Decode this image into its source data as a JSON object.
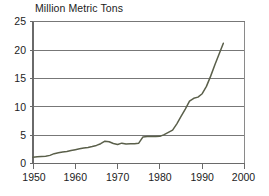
{
  "chart_data": {
    "type": "line",
    "title": "Million Metric Tons",
    "xlabel": "",
    "ylabel": "",
    "xlim": [
      1950,
      2000
    ],
    "ylim": [
      0,
      25
    ],
    "grid": true,
    "legend": "none",
    "x_ticks": [
      "1950",
      "1960",
      "1970",
      "1980",
      "1990",
      "2000"
    ],
    "x_tick_values": [
      1950,
      1960,
      1970,
      1980,
      1990,
      2000
    ],
    "y_ticks": [
      "0",
      "5",
      "10",
      "15",
      "20",
      "25"
    ],
    "y_tick_values": [
      0,
      5,
      10,
      15,
      20,
      25
    ],
    "line_color": "#5a5f4a",
    "series": [
      {
        "name": "Million Metric Tons",
        "x": [
          1950,
          1951,
          1952,
          1953,
          1954,
          1955,
          1956,
          1957,
          1958,
          1959,
          1960,
          1961,
          1962,
          1963,
          1964,
          1965,
          1966,
          1967,
          1968,
          1969,
          1970,
          1971,
          1972,
          1973,
          1974,
          1975,
          1976,
          1977,
          1978,
          1979,
          1980,
          1981,
          1982,
          1983,
          1984,
          1985,
          1986,
          1987,
          1988,
          1989,
          1990,
          1991,
          1992,
          1993,
          1994,
          1995
        ],
        "values": [
          1.1,
          1.2,
          1.25,
          1.3,
          1.45,
          1.75,
          1.9,
          2.05,
          2.15,
          2.3,
          2.45,
          2.6,
          2.75,
          2.85,
          3.0,
          3.2,
          3.5,
          3.95,
          3.85,
          3.55,
          3.35,
          3.6,
          3.45,
          3.5,
          3.5,
          3.6,
          4.7,
          4.75,
          4.75,
          4.75,
          4.8,
          5.1,
          5.5,
          5.9,
          7.0,
          8.3,
          9.6,
          11.0,
          11.5,
          11.7,
          12.3,
          13.6,
          15.4,
          17.4,
          19.3,
          21.2
        ]
      }
    ]
  }
}
